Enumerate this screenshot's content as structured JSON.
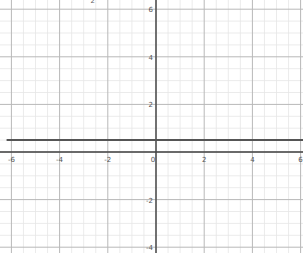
{
  "chart_data": {
    "type": "line",
    "title": "",
    "xlabel": "",
    "ylabel": "",
    "xlim": [
      -6.2,
      6.1
    ],
    "ylim": [
      -4.2,
      6.3
    ],
    "grid": true,
    "minor_grid_step": 0.5,
    "major_grid_step": 2,
    "x_ticks": [
      -6,
      -4,
      -2,
      0,
      2,
      4,
      6
    ],
    "x_tick_labels": [
      "-6",
      "-4",
      "-2",
      "0",
      "2",
      "4",
      "6"
    ],
    "y_ticks": [
      6,
      4,
      2,
      -2,
      -4
    ],
    "y_tick_labels": [
      "6",
      "4",
      "2",
      "-2",
      "-4"
    ],
    "series": [
      {
        "name": "horizontal line",
        "x": [
          -6.2,
          6.1
        ],
        "y": [
          0.5,
          0.5
        ],
        "color": "#555555"
      }
    ],
    "annotations": [
      {
        "text": "2",
        "x": -3.0,
        "y": 6.3,
        "note": "clipped label at top edge"
      }
    ]
  },
  "colors": {
    "minor_grid": "#e6e6e6",
    "major_grid": "#b8b8b8",
    "axis": "#444444",
    "series": "#555555"
  }
}
